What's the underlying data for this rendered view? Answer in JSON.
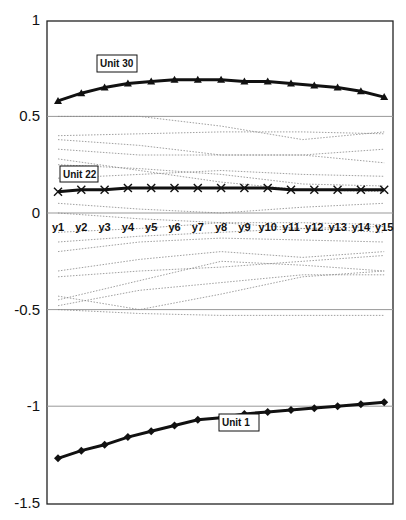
{
  "chart_data": {
    "type": "line",
    "title": "",
    "xlabel": "",
    "ylabel": "",
    "ylim": [
      -1.5,
      1
    ],
    "yticks": [
      "1",
      "0.5",
      "0",
      "-0.5",
      "-1",
      "-1.5"
    ],
    "categories": [
      "y1",
      "y2",
      "y3",
      "y4",
      "y5",
      "y6",
      "y7",
      "y8",
      "y9",
      "y10",
      "y11",
      "y12",
      "y13",
      "y14",
      "y15"
    ],
    "grid": "horizontal at 0.5, 0, -0.5, -1",
    "legend": "none (inline labels)",
    "annotations": [
      "Unit 30",
      "Unit 22",
      "Unit 1"
    ],
    "series": [
      {
        "name": "Unit 30",
        "marker": "triangle",
        "values": [
          0.58,
          0.62,
          0.65,
          0.67,
          0.68,
          0.69,
          0.69,
          0.69,
          0.68,
          0.68,
          0.67,
          0.66,
          0.65,
          0.63,
          0.6
        ]
      },
      {
        "name": "Unit 22",
        "marker": "x",
        "values": [
          0.11,
          0.12,
          0.12,
          0.13,
          0.13,
          0.13,
          0.13,
          0.13,
          0.13,
          0.13,
          0.12,
          0.12,
          0.12,
          0.12,
          0.12
        ]
      },
      {
        "name": "Unit 1",
        "marker": "diamond",
        "values": [
          -1.27,
          -1.23,
          -1.2,
          -1.16,
          -1.13,
          -1.1,
          -1.07,
          -1.06,
          -1.04,
          -1.03,
          -1.02,
          -1.01,
          -1.0,
          -0.99,
          -0.98
        ]
      }
    ],
    "background_series_note": "many thin dotted grey lines between -0.55 and 0.5"
  }
}
